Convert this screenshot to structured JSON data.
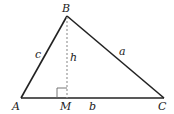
{
  "diagram": {
    "type": "triangle-with-altitude",
    "colors": {
      "stroke": "#222222",
      "altitude": "#999999",
      "background": "#ffffff"
    },
    "vertices": {
      "A": {
        "label": "A",
        "x": 21,
        "y": 98
      },
      "B": {
        "label": "B",
        "x": 67,
        "y": 16
      },
      "C": {
        "label": "C",
        "x": 164,
        "y": 98
      },
      "M": {
        "label": "M",
        "x": 67,
        "y": 98
      }
    },
    "sides": {
      "a": {
        "label": "a",
        "from": "B",
        "to": "C"
      },
      "b": {
        "label": "b",
        "from": "A",
        "to": "C"
      },
      "c": {
        "label": "c",
        "from": "A",
        "to": "B"
      }
    },
    "altitude": {
      "label": "h",
      "from": "B",
      "to": "M",
      "style": "dashed"
    },
    "right_angle_marker": {
      "at": "M",
      "size": 10
    }
  }
}
